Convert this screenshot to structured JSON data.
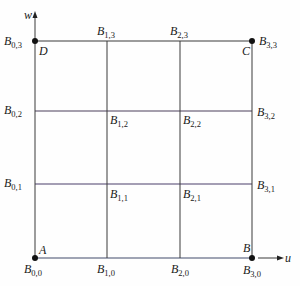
{
  "diagram": {
    "type": "control-point-grid",
    "axes": {
      "horizontal": "u",
      "vertical": "w"
    },
    "corners": {
      "A": "B0,0",
      "B": "B3,0",
      "C": "B3,3",
      "D": "B0,3"
    },
    "corner_labels": [
      "A",
      "B",
      "C",
      "D"
    ],
    "grid_size": [
      4,
      4
    ],
    "points": [
      {
        "name": "B",
        "sub": "0,0"
      },
      {
        "name": "B",
        "sub": "1,0"
      },
      {
        "name": "B",
        "sub": "2,0"
      },
      {
        "name": "B",
        "sub": "3,0"
      },
      {
        "name": "B",
        "sub": "0,1"
      },
      {
        "name": "B",
        "sub": "1,1"
      },
      {
        "name": "B",
        "sub": "2,1"
      },
      {
        "name": "B",
        "sub": "3,1"
      },
      {
        "name": "B",
        "sub": "0,2"
      },
      {
        "name": "B",
        "sub": "1,2"
      },
      {
        "name": "B",
        "sub": "2,2"
      },
      {
        "name": "B",
        "sub": "3,2"
      },
      {
        "name": "B",
        "sub": "0,3"
      },
      {
        "name": "B",
        "sub": "1,3"
      },
      {
        "name": "B",
        "sub": "2,3"
      },
      {
        "name": "B",
        "sub": "3,3"
      }
    ]
  },
  "labels": {
    "axis_u": "u",
    "axis_w": "w",
    "A": "A",
    "B": "B",
    "C": "C",
    "D": "D",
    "b": "B",
    "s00": "0,0",
    "s10": "1,0",
    "s20": "2,0",
    "s30": "3,0",
    "s01": "0,1",
    "s11": "1,1",
    "s21": "2,1",
    "s31": "3,1",
    "s02": "0,2",
    "s12": "1,2",
    "s22": "2,2",
    "s32": "3,2",
    "s03": "0,3",
    "s13": "1,3",
    "s23": "2,3",
    "s33": "3,3"
  },
  "colors": {
    "line": "#3a3a3a",
    "point": "#111111",
    "text": "#1a1a1a"
  }
}
